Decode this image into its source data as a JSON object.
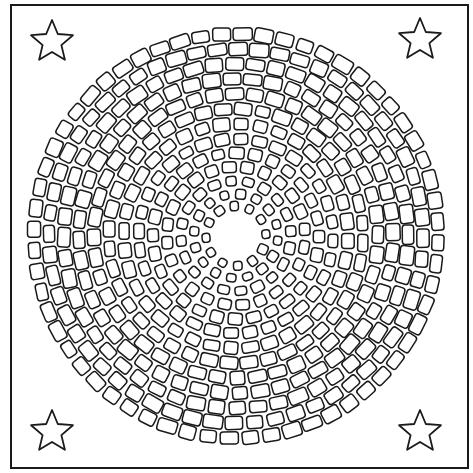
{
  "page": {
    "background": "#ffffff",
    "line_color": "#1a1a1a"
  },
  "frame": {
    "x": 11,
    "y": 5,
    "width": 457,
    "height": 463
  },
  "stars": [
    {
      "name": "top-left",
      "cx": 52,
      "cy": 42,
      "r": 22
    },
    {
      "name": "top-right",
      "cx": 420,
      "cy": 40,
      "r": 22
    },
    {
      "name": "bottom-left",
      "cx": 52,
      "cy": 432,
      "r": 22
    },
    {
      "name": "bottom-right",
      "cx": 420,
      "cy": 432,
      "r": 22
    }
  ],
  "mosaic": {
    "cx": 236,
    "cy": 236,
    "inner_radius": 22,
    "rings": [
      {
        "r": 30,
        "count": 12,
        "w": 9,
        "h": 9
      },
      {
        "r": 42,
        "count": 16,
        "w": 10,
        "h": 9
      },
      {
        "r": 55,
        "count": 20,
        "w": 12,
        "h": 10
      },
      {
        "r": 69,
        "count": 24,
        "w": 13,
        "h": 11
      },
      {
        "r": 83,
        "count": 28,
        "w": 14,
        "h": 11
      },
      {
        "r": 97,
        "count": 32,
        "w": 15,
        "h": 11
      },
      {
        "r": 112,
        "count": 36,
        "w": 16,
        "h": 12
      },
      {
        "r": 127,
        "count": 40,
        "w": 17,
        "h": 12
      },
      {
        "r": 142,
        "count": 44,
        "w": 17,
        "h": 13
      },
      {
        "r": 157,
        "count": 48,
        "w": 17,
        "h": 13
      },
      {
        "r": 172,
        "count": 52,
        "w": 18,
        "h": 13
      },
      {
        "r": 187,
        "count": 56,
        "w": 18,
        "h": 13
      },
      {
        "r": 202,
        "count": 60,
        "w": 18,
        "h": 13
      }
    ]
  }
}
